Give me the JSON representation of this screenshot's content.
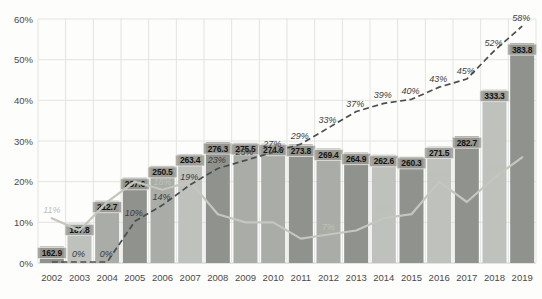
{
  "colors": {
    "background": "#fdfdfc",
    "grid": "#e3e3e1",
    "axis_line": "#c9c9c7",
    "axis_text": "#4a4a4a",
    "bar_dark": "#8f928d",
    "bar_medium": "#a9aca7",
    "bar_light": "#bec1bc",
    "value_chip_bg": "#96968f",
    "value_chip_border": "#e9e9e6",
    "value_text": "#131313",
    "dashed_line": "#4d4d4d",
    "dashed_label": "#3d3d3d",
    "solid_line": "#c3c7be",
    "solid_label": "#bdc2b8"
  },
  "chart_data": {
    "type": "combo",
    "title": "",
    "categories": [
      "2002",
      "2003",
      "2004",
      "2005",
      "2006",
      "2007",
      "2008",
      "2009",
      "2010",
      "2011",
      "2012",
      "2013",
      "2014",
      "2015",
      "2016",
      "2017",
      "2018",
      "2019"
    ],
    "y_axis": {
      "ticks": [
        "0%",
        "10%",
        "20%",
        "30%",
        "40%",
        "50%",
        "60%"
      ],
      "min": 0,
      "max": 60,
      "grid": true
    },
    "layout_hints": {
      "legend": "none",
      "grid": "horizontal and vertical light gray",
      "bar_scale_hint": {
        "min": 145,
        "max": 410,
        "note": "bars plotted on hidden secondary axis spanning the 0-60% plot height"
      }
    },
    "series": [
      {
        "name": "bars",
        "type": "bar",
        "values": [
          162.9,
          187.8,
          212.7,
          237.6,
          250.5,
          263.4,
          276.3,
          275.5,
          274.6,
          273.8,
          269.4,
          264.9,
          262.6,
          260.3,
          271.5,
          282.7,
          333.3,
          383.8
        ],
        "value_labels": [
          "162.9",
          "187.8",
          "212.7",
          "237.6",
          "250.5",
          "263.4",
          "276.3",
          "275.5",
          "274.6",
          "273.8",
          "269.4",
          "264.9",
          "262.6",
          "260.3",
          "271.5",
          "282.7",
          "333.3",
          "383.8"
        ],
        "shades": [
          "dark",
          "light",
          "medium",
          "dark",
          "medium",
          "light",
          "dark",
          "medium",
          "medium",
          "dark",
          "medium",
          "dark",
          "light",
          "dark",
          "light",
          "dark",
          "light",
          "dark"
        ]
      },
      {
        "name": "dashed_line",
        "type": "line",
        "style": "dashed",
        "values_pct": [
          0,
          0,
          0,
          10,
          14,
          19,
          23,
          25,
          27,
          29,
          33,
          37,
          39,
          40,
          43,
          45,
          52,
          58
        ],
        "labels": [
          "",
          "0%",
          "0%",
          "10%",
          "14%",
          "19%",
          "23%",
          "25%",
          "27%",
          "29%",
          "33%",
          "37%",
          "39%",
          "40%",
          "43%",
          "45%",
          "52%",
          "58%"
        ]
      },
      {
        "name": "solid_line",
        "type": "line",
        "style": "solid",
        "values_pct": [
          11,
          8,
          15,
          20,
          18,
          20,
          12,
          10,
          10,
          6,
          7,
          8,
          11,
          12,
          20,
          15,
          21,
          26
        ],
        "labels": [
          "11%",
          "",
          "",
          "",
          "18%",
          "",
          "",
          "",
          "",
          "",
          "7%",
          "",
          "11%",
          "",
          "20%",
          "",
          "21%",
          ""
        ]
      }
    ]
  }
}
